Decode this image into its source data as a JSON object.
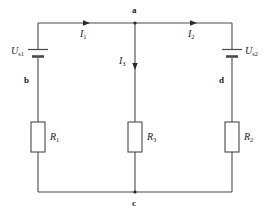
{
  "diagram": {
    "stroke_color": "#4a4a4a",
    "text_color": "#1a1a1a",
    "background": "#ffffff"
  },
  "nodes": [
    {
      "id": "a",
      "label": "a"
    },
    {
      "id": "b",
      "label": "b"
    },
    {
      "id": "c",
      "label": "c"
    },
    {
      "id": "d",
      "label": "d"
    }
  ],
  "sources": [
    {
      "id": "left-source",
      "symbol": "U",
      "subscript": "s1",
      "label": "U",
      "sub": "s1"
    },
    {
      "id": "right-source",
      "symbol": "U",
      "subscript": "s2",
      "label": "U",
      "sub": "s2"
    }
  ],
  "resistors": [
    {
      "id": "left-resistor",
      "symbol": "R",
      "subscript": "1",
      "label": "R",
      "sub": "1"
    },
    {
      "id": "middle-resistor",
      "symbol": "R",
      "subscript": "3",
      "label": "R",
      "sub": "3"
    },
    {
      "id": "right-resistor",
      "symbol": "R",
      "subscript": "2",
      "label": "R",
      "sub": "2"
    }
  ],
  "currents": [
    {
      "id": "current-1",
      "symbol": "I",
      "subscript": "1",
      "label": "I",
      "sub": "1",
      "direction": "right",
      "branch": "left-top"
    },
    {
      "id": "current-2",
      "symbol": "I",
      "subscript": "2",
      "label": "I",
      "sub": "2",
      "direction": "left",
      "branch": "right-top"
    },
    {
      "id": "current-3",
      "symbol": "I",
      "subscript": "3",
      "label": "I",
      "sub": "3",
      "direction": "down",
      "branch": "middle"
    }
  ]
}
